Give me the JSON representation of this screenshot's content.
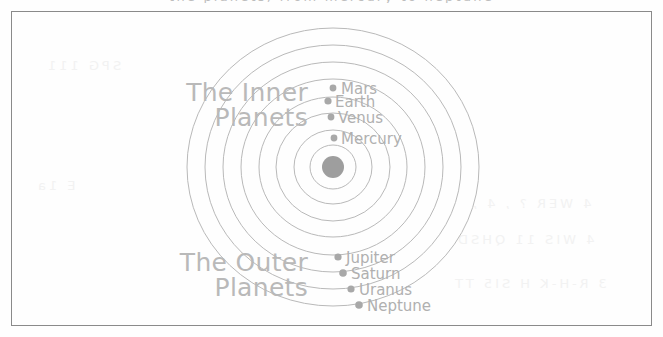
{
  "diagram": {
    "title_crop": "the planets, from mercury to neptune",
    "frame_color": "#8a8a8a",
    "ink_color": "#b9b9b9",
    "sun": {
      "name": "Sun",
      "center_x": 333,
      "center_y": 167,
      "radius": 11,
      "color": "#9e9e9e"
    },
    "groups": [
      {
        "id": "inner",
        "line1": "The Inner",
        "line2": "Planets"
      },
      {
        "id": "outer",
        "line1": "The Outer",
        "line2": "Planets"
      }
    ],
    "planets": [
      {
        "name": "Mercury",
        "group": "inner",
        "orbit_index": 1,
        "rx": 23,
        "ry": 22,
        "dot_x": 334,
        "dot_y": 138,
        "label_x": 341,
        "label_y": 132,
        "dot_r": 3.4
      },
      {
        "name": "Venus",
        "group": "inner",
        "orbit_index": 2,
        "rx": 39,
        "ry": 37,
        "dot_x": 331,
        "dot_y": 117,
        "label_x": 338,
        "label_y": 111,
        "dot_r": 3.4
      },
      {
        "name": "Earth",
        "group": "inner",
        "orbit_index": 3,
        "rx": 57,
        "ry": 54,
        "dot_x": 328,
        "dot_y": 101,
        "label_x": 335,
        "label_y": 95,
        "dot_r": 3.6
      },
      {
        "name": "Mars",
        "group": "inner",
        "orbit_index": 4,
        "rx": 74,
        "ry": 70,
        "dot_x": 333,
        "dot_y": 88,
        "label_x": 341,
        "label_y": 82,
        "dot_r": 3.4
      },
      {
        "name": "Jupiter",
        "group": "outer",
        "orbit_index": 5,
        "rx": 92,
        "ry": 88,
        "dot_x": 338,
        "dot_y": 257,
        "label_x": 346,
        "label_y": 251,
        "dot_r": 3.6
      },
      {
        "name": "Saturn",
        "group": "outer",
        "orbit_index": 6,
        "rx": 110,
        "ry": 105,
        "dot_x": 343,
        "dot_y": 273,
        "label_x": 351,
        "label_y": 267,
        "dot_r": 3.8
      },
      {
        "name": "Uranus",
        "group": "outer",
        "orbit_index": 7,
        "rx": 128,
        "ry": 122,
        "dot_x": 351,
        "dot_y": 289,
        "label_x": 359,
        "label_y": 283,
        "dot_r": 3.6
      },
      {
        "name": "Neptune",
        "group": "outer",
        "orbit_index": 8,
        "rx": 146,
        "ry": 139,
        "dot_x": 359,
        "dot_y": 305,
        "label_x": 367,
        "label_y": 299,
        "dot_r": 3.8
      }
    ],
    "bleed_through": [
      {
        "text": "4 WER  ?  , 4  ,",
        "x": 470,
        "y": 196
      },
      {
        "text": "4 WIS    11  QHSD",
        "x": 455,
        "y": 232
      },
      {
        "text": "3  R-H-K    H  SI5  TT",
        "x": 452,
        "y": 276
      },
      {
        "text": "SPG  111",
        "x": 45,
        "y": 58
      },
      {
        "text": "E 1a",
        "x": 35,
        "y": 178
      }
    ]
  }
}
